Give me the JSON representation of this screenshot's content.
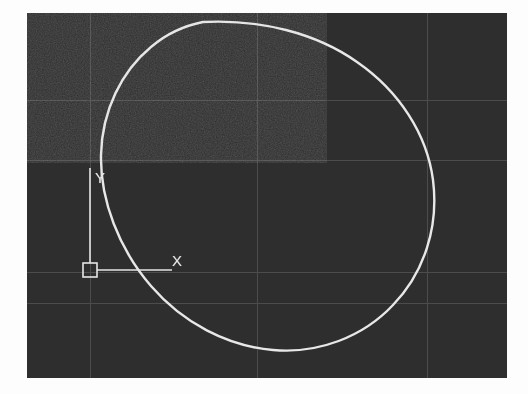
{
  "app": {
    "type": "cad-viewport-screenshot",
    "title": "CAD drawing viewport",
    "canvas_width": 528,
    "canvas_height": 394
  },
  "colors": {
    "page_background": "#fdfdfd",
    "viewport_background": "#2e2e2e",
    "grid_line": "#4c4c4c",
    "geometry_stroke": "#e8e8e8",
    "ucs_stroke": "#e6e6e6",
    "label_text": "#e6e6e6"
  },
  "viewport": {
    "x": 27,
    "y": 13,
    "width": 480,
    "height": 365,
    "grid_visible": true,
    "grid_vertical_x": [
      63,
      230,
      400
    ],
    "grid_horizontal_y": [
      87,
      147,
      259,
      290
    ]
  },
  "ucs_icon": {
    "name": "ucs-coordinate-icon",
    "origin_x": 90,
    "origin_y": 270,
    "square_size": 14,
    "x_axis_length": 75,
    "y_axis_length": 100,
    "x_label": "X",
    "y_label": "Y",
    "x_label_pos": {
      "x": 178,
      "y": 261
    },
    "y_label_pos": {
      "x": 101,
      "y": 178
    }
  },
  "geometry": {
    "entities": [
      {
        "name": "circle-entity",
        "type": "circle",
        "center_x": 256,
        "center_y": 184,
        "radius_x": 177,
        "radius_y": 162,
        "stroke_width": 2.4,
        "bounds": {
          "left": 79,
          "top": 22,
          "right": 433,
          "bottom": 346
        }
      }
    ]
  },
  "chart_data": {
    "type": "scatter",
    "title": "",
    "xlabel": "X",
    "ylabel": "Y",
    "legend": [],
    "annotations": [
      "X",
      "Y"
    ],
    "grid": true,
    "xlim": [
      0,
      480
    ],
    "ylim": [
      0,
      365
    ],
    "series": [
      {
        "name": "circle",
        "shape": "ellipse",
        "center": [
          229,
          171
        ],
        "radii": [
          177,
          162
        ]
      }
    ]
  }
}
